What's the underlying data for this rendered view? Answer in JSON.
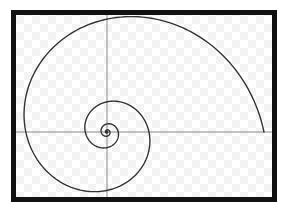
{
  "diagram": {
    "type": "logarithmic-spiral",
    "frame": {
      "x": 13.5,
      "y": 12.5,
      "width": 261,
      "height": 187,
      "stroke_width": 5,
      "color": "#111111"
    },
    "background": {
      "checker_size": 8,
      "color_a": "#ffffff",
      "color_b": "#f3f3f3"
    },
    "axes": {
      "center_x": 107,
      "center_y": 132,
      "color": "#8a8a8a",
      "stroke_width": 1
    },
    "spiral": {
      "center_x": 107,
      "center_y": 132,
      "start_radius": 157,
      "growth_per_radian": 0.21,
      "turns": 5.2,
      "color": "#333333",
      "stroke_width": 1.4
    }
  }
}
